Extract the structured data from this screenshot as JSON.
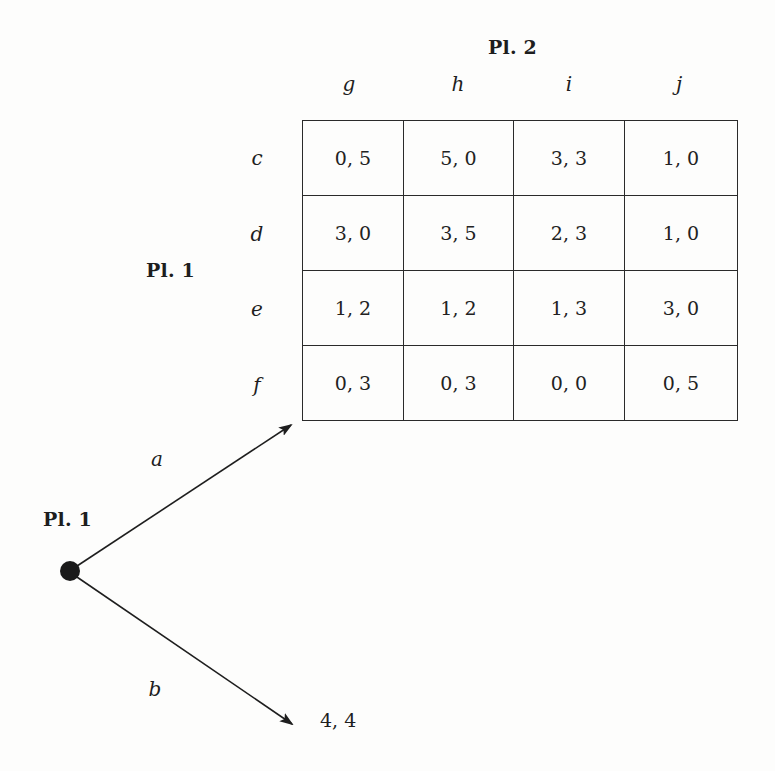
{
  "figure": {
    "column_player": {
      "label": "Pl. 2",
      "strategies": [
        "g",
        "h",
        "i",
        "j"
      ]
    },
    "row_player": {
      "label": "Pl. 1",
      "strategies": [
        "c",
        "d",
        "e",
        "f"
      ]
    },
    "payoff_matrix": [
      [
        "0, 5",
        "5, 0",
        "3, 3",
        "1, 0"
      ],
      [
        "3, 0",
        "3, 5",
        "2, 3",
        "1, 0"
      ],
      [
        "1, 2",
        "1, 2",
        "1, 3",
        "3, 0"
      ],
      [
        "0, 3",
        "0, 3",
        "0, 0",
        "0, 5"
      ]
    ],
    "tree": {
      "root_player_label": "Pl. 1",
      "branches": [
        {
          "action": "a",
          "leads_to": "matrix"
        },
        {
          "action": "b",
          "payoff": "4, 4"
        }
      ]
    }
  },
  "colors": {
    "ink": "#1e1e1e",
    "paper": "#fdfdfc",
    "grid_line": "#2a2a2a"
  }
}
